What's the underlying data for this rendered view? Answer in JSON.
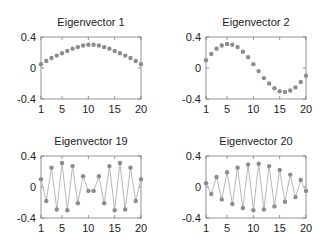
{
  "chart_data": [
    {
      "type": "line",
      "title": "Eigenvector 1",
      "x": [
        1,
        2,
        3,
        4,
        5,
        6,
        7,
        8,
        9,
        10,
        11,
        12,
        13,
        14,
        15,
        16,
        17,
        18,
        19,
        20
      ],
      "series": [
        {
          "name": "Eigenvector 1",
          "values": [
            0.05,
            0.09,
            0.13,
            0.16,
            0.19,
            0.22,
            0.25,
            0.27,
            0.29,
            0.3,
            0.3,
            0.29,
            0.27,
            0.25,
            0.22,
            0.19,
            0.16,
            0.13,
            0.09,
            0.05
          ]
        }
      ],
      "xticks": [
        "1",
        "5",
        "10",
        "15",
        "20"
      ],
      "yticks": [
        "0.4",
        "0",
        "-0.4"
      ],
      "xlim": [
        1,
        20
      ],
      "ylim": [
        -0.4,
        0.4
      ],
      "xlabel": "",
      "ylabel": "",
      "grid": false,
      "legend": "none"
    },
    {
      "type": "line",
      "title": "Eigenvector 2",
      "x": [
        1,
        2,
        3,
        4,
        5,
        6,
        7,
        8,
        9,
        10,
        11,
        12,
        13,
        14,
        15,
        16,
        17,
        18,
        19,
        20
      ],
      "series": [
        {
          "name": "Eigenvector 2",
          "values": [
            0.1,
            0.18,
            0.25,
            0.29,
            0.31,
            0.3,
            0.27,
            0.21,
            0.14,
            0.05,
            -0.04,
            -0.13,
            -0.2,
            -0.26,
            -0.3,
            -0.31,
            -0.29,
            -0.25,
            -0.18,
            -0.1
          ]
        }
      ],
      "xticks": [
        "1",
        "5",
        "10",
        "15",
        "20"
      ],
      "yticks": [
        "0.4",
        "0",
        "-0.4"
      ],
      "xlim": [
        1,
        20
      ],
      "ylim": [
        -0.4,
        0.4
      ],
      "xlabel": "",
      "ylabel": "",
      "grid": false,
      "legend": "none"
    },
    {
      "type": "line",
      "title": "Eigenvector 19",
      "x": [
        1,
        2,
        3,
        4,
        5,
        6,
        7,
        8,
        9,
        10,
        11,
        12,
        13,
        14,
        15,
        16,
        17,
        18,
        19,
        20
      ],
      "series": [
        {
          "name": "Eigenvector 19",
          "values": [
            0.1,
            -0.18,
            0.25,
            -0.29,
            0.31,
            -0.3,
            0.27,
            -0.21,
            0.14,
            -0.05,
            -0.05,
            0.14,
            -0.21,
            0.27,
            -0.3,
            0.31,
            -0.29,
            0.25,
            -0.18,
            0.1
          ]
        }
      ],
      "xticks": [
        "1",
        "5",
        "10",
        "15",
        "20"
      ],
      "yticks": [
        "0.4",
        "0",
        "-0.4"
      ],
      "xlim": [
        1,
        20
      ],
      "ylim": [
        -0.4,
        0.4
      ],
      "xlabel": "",
      "ylabel": "",
      "grid": false,
      "legend": "none"
    },
    {
      "type": "line",
      "title": "Eigenvector 20",
      "x": [
        1,
        2,
        3,
        4,
        5,
        6,
        7,
        8,
        9,
        10,
        11,
        12,
        13,
        14,
        15,
        16,
        17,
        18,
        19,
        20
      ],
      "series": [
        {
          "name": "Eigenvector 20",
          "values": [
            0.05,
            -0.09,
            0.13,
            -0.16,
            0.19,
            -0.22,
            0.25,
            -0.27,
            0.29,
            -0.3,
            0.3,
            -0.29,
            0.27,
            -0.25,
            0.22,
            -0.19,
            0.16,
            -0.13,
            0.09,
            -0.05
          ]
        }
      ],
      "xticks": [
        "1",
        "5",
        "10",
        "15",
        "20"
      ],
      "yticks": [
        "0.4",
        "0",
        "-0.4"
      ],
      "xlim": [
        1,
        20
      ],
      "ylim": [
        -0.4,
        0.4
      ],
      "xlabel": "",
      "ylabel": "",
      "grid": false,
      "legend": "none"
    }
  ],
  "style": {
    "line_color": "#b8b8b8",
    "marker_color": "#8c8c8c",
    "axes_color": "#7a7a7a",
    "text_color": "#222222"
  }
}
